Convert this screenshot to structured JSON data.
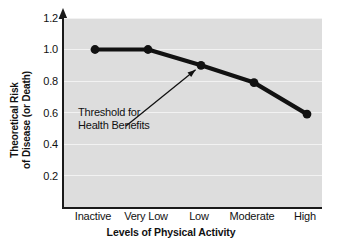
{
  "chart_data": {
    "type": "line",
    "title": "",
    "subtitle": "",
    "xlabel": "Levels of Physical Activity",
    "ylabel_line1": "Theoretical Risk",
    "ylabel_line2": "of Disease (or Death)",
    "categories": [
      "Inactive",
      "Very Low",
      "Low",
      "Moderate",
      "High"
    ],
    "values": [
      1.0,
      1.0,
      0.9,
      0.79,
      0.59
    ],
    "ylim": [
      0.0,
      1.2
    ],
    "yticks": [
      "1.2",
      "1.0",
      "0.8",
      "0.6",
      "0.4",
      "0.2"
    ],
    "ytick_values": [
      1.2,
      1.0,
      0.8,
      0.6,
      0.4,
      0.2
    ],
    "grid": true,
    "legend": "none",
    "series_color": "#111111",
    "plot_background": "#dddddd",
    "gridline_color": "#f2f2f2",
    "annotations": [
      {
        "name": "threshold-annotation",
        "line1": "Threshold for",
        "line2": "Health Benefits",
        "points_to_category": "Low",
        "points_to_value": 0.9
      }
    ]
  }
}
